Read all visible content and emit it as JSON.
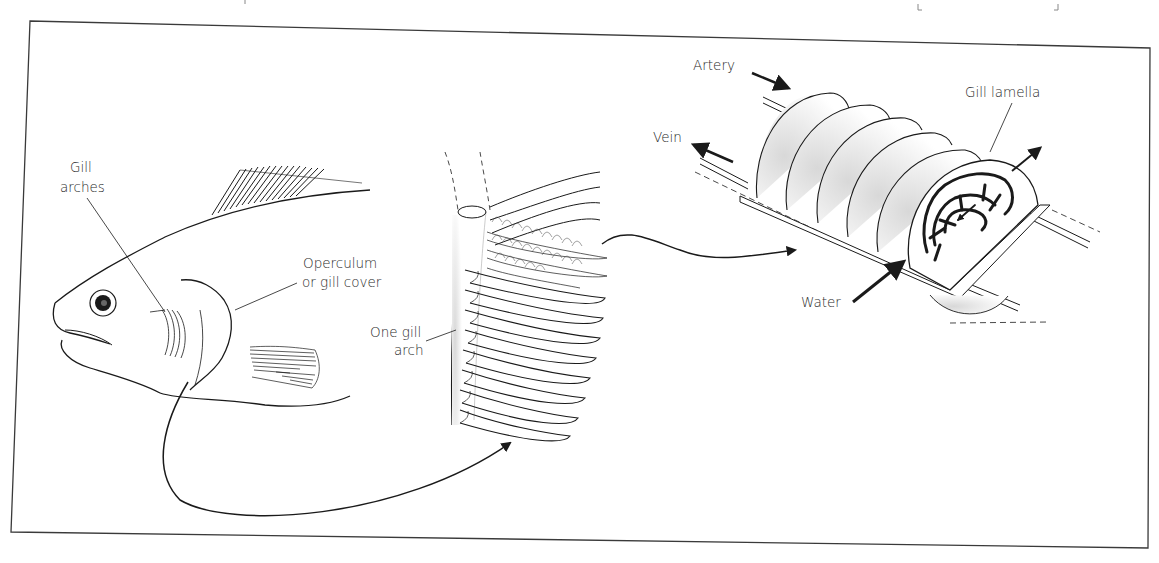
{
  "figure": {
    "type": "gill anatomy diagram",
    "panels": [
      {
        "name": "fish",
        "labels": {
          "gill_arches": [
            "Gill",
            "arches"
          ],
          "operculum": [
            "Operculum",
            "or gill cover"
          ]
        }
      },
      {
        "name": "gill-arch",
        "labels": {
          "one_gill_arch": [
            "One gill",
            "arch"
          ]
        }
      },
      {
        "name": "gill-filament",
        "labels": {
          "artery": "Artery",
          "vein": "Vein",
          "gill_lamella": "Gill lamella",
          "water": "Water"
        }
      }
    ]
  },
  "colors": {
    "line": "#1a1a1a",
    "frame": "#3a3a3a",
    "stipple": "#bdbdbd",
    "background": "#ffffff"
  }
}
